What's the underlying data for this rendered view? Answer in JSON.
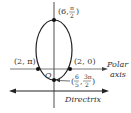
{
  "diagram": {
    "type": "polar-conic-ellipse",
    "points": [
      {
        "label": "(6, π/2)",
        "r": "6",
        "theta_num": "π",
        "theta_den": "2"
      },
      {
        "label": "(2, π)",
        "text": "(2, π)"
      },
      {
        "label": "(2, 0)",
        "text": "(2, 0)"
      },
      {
        "label": "(6/5, 3π/2)",
        "r_num": "6",
        "r_den": "5",
        "theta_num": "3π",
        "theta_den": "2"
      }
    ],
    "origin_label": "O",
    "polar_axis_label_1": "Polar",
    "polar_axis_label_2": "axis",
    "directrix_label": "Directrix",
    "colors": {
      "stroke": "#222222",
      "text": "#333333",
      "background": "#ffffff"
    }
  }
}
